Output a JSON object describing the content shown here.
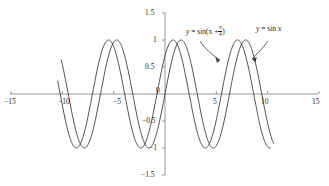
{
  "figure": {
    "background": "#ffffff",
    "axis_color": "#8a8a8a",
    "curve_color": "#3a3a3a",
    "text_color": "#231f20"
  },
  "annotations": {
    "shifted": {
      "prefix": "y",
      "equals": "= sin(x +",
      "num": "π",
      "den": "4",
      "suffix": ")",
      "full": "y = sin(x + π/4)"
    },
    "plain": {
      "prefix": "y",
      "equals": "= sin",
      "var": "x",
      "full": "y = sin x"
    }
  },
  "x_tick_labels": [
    "−15",
    "−10",
    "−5",
    "5",
    "10",
    "15"
  ],
  "y_tick_labels": [
    "1.5",
    "1",
    "0.5",
    "−0.5",
    "−1",
    "−1.5"
  ],
  "origin_label": "0",
  "chart_data": {
    "type": "line",
    "title": "",
    "xlabel": "",
    "ylabel": "",
    "xlim": [
      -15,
      15
    ],
    "ylim": [
      -1.5,
      1.5
    ],
    "xticks": [
      -15,
      -10,
      -5,
      0,
      5,
      10,
      15
    ],
    "yticks": [
      -1.5,
      -1,
      -0.5,
      0,
      0.5,
      1,
      1.5
    ],
    "grid": false,
    "legend": "annotated-arrows",
    "domain_drawn": [
      -10.45,
      10.6
    ],
    "series": [
      {
        "name": "y = sin(x + π/4)",
        "formula": "sin(x + pi/4)",
        "amplitude": 1,
        "period": 6.2832,
        "phase_shift": -0.7854,
        "color": "#3a3a3a",
        "x_start": -10.45,
        "x_end": 10.3
      },
      {
        "name": "y = sin x",
        "formula": "sin(x)",
        "amplitude": 1,
        "period": 6.2832,
        "phase_shift": 0,
        "color": "#3a3a3a",
        "x_start": -10.1,
        "x_end": 10.6
      }
    ]
  }
}
